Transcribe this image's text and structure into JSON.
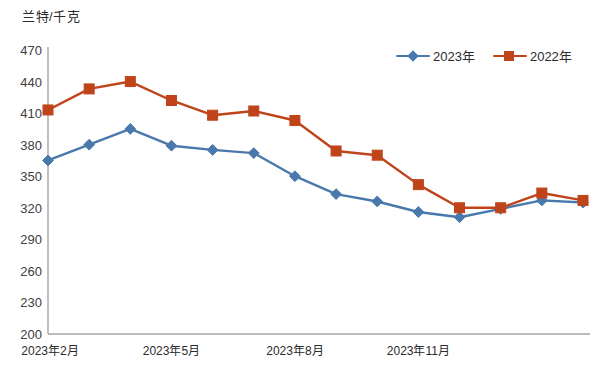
{
  "chart_data": {
    "type": "line",
    "title": "",
    "subtitle": "",
    "ylabel": "兰特/千克",
    "xlabel": "",
    "ylim": [
      200,
      470
    ],
    "ytick_step": 30,
    "yticks": [
      "470",
      "440",
      "410",
      "380",
      "350",
      "320",
      "290",
      "260",
      "230",
      "200"
    ],
    "ytick_values": [
      470,
      440,
      410,
      380,
      350,
      320,
      290,
      260,
      230,
      200
    ],
    "grid": false,
    "legend_position": "top-right",
    "x_tick_labels": [
      {
        "label": "2023年2月",
        "index": 0
      },
      {
        "label": "2023年5月",
        "index": 3
      },
      {
        "label": "2023年8月",
        "index": 6
      },
      {
        "label": "2023年11月",
        "index": 9
      }
    ],
    "x_count": 14,
    "series": [
      {
        "name": "2023年",
        "color": "#4979AC",
        "marker": "diamond",
        "values": [
          365,
          380,
          395,
          379,
          375,
          372,
          350,
          333,
          326,
          316,
          311,
          319,
          327,
          325
        ]
      },
      {
        "name": "2022年",
        "color": "#C0441A",
        "marker": "square",
        "values": [
          413,
          433,
          440,
          422,
          408,
          412,
          403,
          374,
          370,
          342,
          320,
          320,
          334,
          327
        ]
      }
    ]
  },
  "axis": {
    "unit_label": "兰特/千克",
    "axis_line_color": "#a6a6a6"
  },
  "legend": {
    "items": [
      {
        "label": "2023年",
        "color": "#4979AC",
        "marker": "diamond"
      },
      {
        "label": "2022年",
        "color": "#C0441A",
        "marker": "square"
      }
    ]
  }
}
